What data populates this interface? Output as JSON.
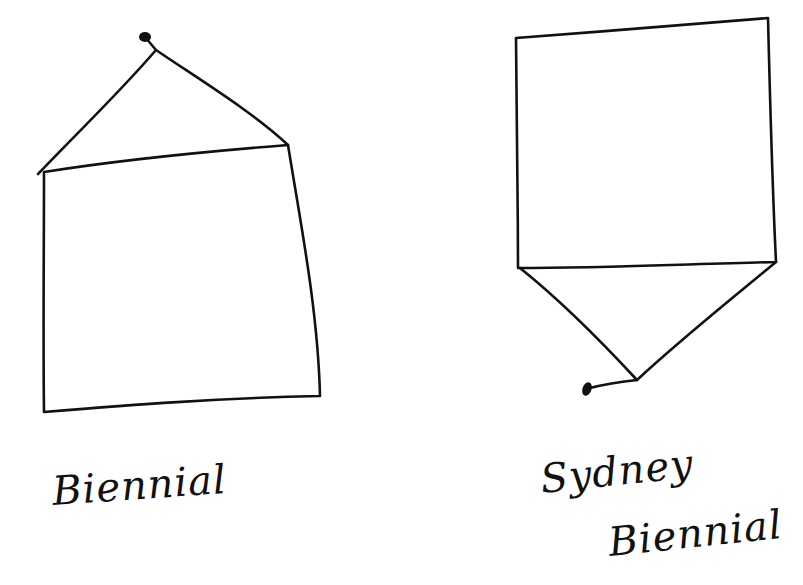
{
  "diagram": {
    "type": "hand-drawn sketch",
    "stroke_color": "#111111",
    "background": "#ffffff",
    "figures": [
      {
        "id": "left",
        "description": "square with triangle on top, dot at apex",
        "label": "Biennial",
        "shapes": [
          "square-body",
          "triangle-roof",
          "apex-dot"
        ]
      },
      {
        "id": "right",
        "description": "square with inverted triangle below, dot at bottom tip",
        "label_lines": [
          "Sydney",
          "Biennial"
        ],
        "shapes": [
          "square-body",
          "inverted-triangle",
          "tip-dot"
        ]
      }
    ]
  }
}
